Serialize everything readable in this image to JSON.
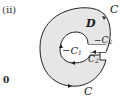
{
  "figure": {
    "number_label": "(ⅱ)",
    "axis_label": "0",
    "region_label": "D",
    "outer_curve_label": "C",
    "outer_curve_label_bottom": "C",
    "inner_curve_label": "−C",
    "inner_curve_sub": "1",
    "cut_upper_label": "−C",
    "cut_upper_sub": "2",
    "cut_lower_label": "C",
    "cut_lower_sub": "2"
  },
  "colors": {
    "region_fill": "#e6e6e6",
    "stroke": "#222222"
  }
}
